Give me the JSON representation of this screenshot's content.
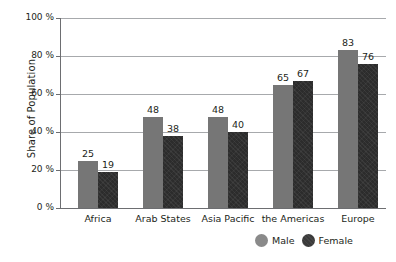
{
  "chart_data": {
    "type": "bar",
    "title": "",
    "xlabel": "",
    "ylabel": "Share of Population",
    "ylim": [
      0,
      100
    ],
    "grid": true,
    "legend_position": "bottom-right",
    "categories": [
      "Africa",
      "Arab States",
      "Asia Pacific",
      "the Americas",
      "Europe"
    ],
    "ytick_labels": [
      "100 %",
      "80 %",
      "60 %",
      "40 %",
      "20 %",
      "0 %"
    ],
    "ytick_values": [
      100,
      80,
      60,
      40,
      20,
      0
    ],
    "series": [
      {
        "name": "Male",
        "color": "#767676",
        "values": [
          25,
          48,
          48,
          65,
          83
        ]
      },
      {
        "name": "Female",
        "color": "#2c2c2c",
        "values": [
          19,
          38,
          40,
          67,
          76
        ]
      }
    ]
  },
  "legend": {
    "items": [
      {
        "label": "Male"
      },
      {
        "label": "Female"
      }
    ]
  },
  "colors": {
    "male_bar": "#767676",
    "female_bar": "#2c2c2c",
    "gridline": "#a7a9ac",
    "axis": "#6d6e71",
    "text": "#231f20",
    "background": "#ffffff"
  }
}
